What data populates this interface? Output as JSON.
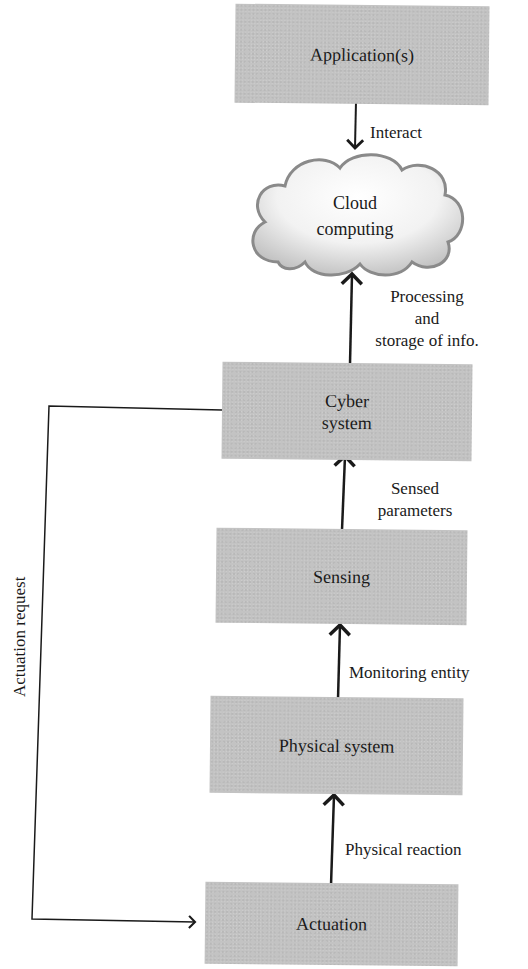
{
  "diagram": {
    "nodes": {
      "applications": "Application(s)",
      "cloud_line1": "Cloud",
      "cloud_line2": "computing",
      "cyber_line1": "Cyber",
      "cyber_line2": "system",
      "sensing": "Sensing",
      "physical_system": "Physical system",
      "actuation": "Actuation"
    },
    "edges": {
      "interact": "Interact",
      "processing_line1": "Processing",
      "processing_line2": "and",
      "processing_line3": "storage of info.",
      "sensed_line1": "Sensed",
      "sensed_line2": "parameters",
      "monitoring": "Monitoring entity",
      "physical_reaction": "Physical reaction",
      "actuation_request": "Actuation request"
    },
    "colors": {
      "box_fill": "#c3c3c3",
      "line": "#1a1a1a"
    }
  }
}
